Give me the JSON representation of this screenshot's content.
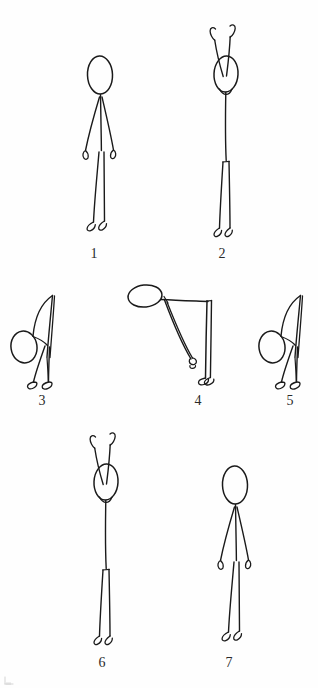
{
  "document": {
    "type": "hand-drawn exercise sequence diagram",
    "subject": "standing forward bend / toe touch stretch sequence",
    "background_color": "#fefefe",
    "ink_color": "#1a1a1a",
    "total_figures": 7
  },
  "figures": [
    {
      "number": "1",
      "pose": "standing upright, arms at sides",
      "orientation": "front view",
      "label_x": 82,
      "label_y": 246,
      "center_x": 100,
      "top_y": 52
    },
    {
      "number": "2",
      "pose": "standing upright, both arms raised overhead",
      "orientation": "front view",
      "label_x": 210,
      "label_y": 246,
      "center_x": 228,
      "top_y": 20
    },
    {
      "number": "3",
      "pose": "bending forward at waist, arms extended down past head",
      "orientation": "side view facing left",
      "label_x": 30,
      "label_y": 393,
      "center_x": 48,
      "top_y": 290
    },
    {
      "number": "4",
      "pose": "deep forward bend, torso horizontal, arms reaching toward feet",
      "orientation": "side view facing left",
      "label_x": 186,
      "label_y": 393,
      "center_x": 204,
      "top_y": 284
    },
    {
      "number": "5",
      "pose": "bending forward at waist, arms extended down past head",
      "orientation": "side view facing left",
      "label_x": 278,
      "label_y": 393,
      "center_x": 296,
      "top_y": 290
    },
    {
      "number": "6",
      "pose": "standing upright, both arms raised overhead",
      "orientation": "front view",
      "label_x": 90,
      "label_y": 655,
      "center_x": 108,
      "top_y": 428
    },
    {
      "number": "7",
      "pose": "standing upright, arms at sides",
      "orientation": "front view",
      "label_x": 217,
      "label_y": 655,
      "center_x": 235,
      "top_y": 462
    }
  ],
  "labels": {
    "one": "1",
    "two": "2",
    "three": "3",
    "four": "4",
    "five": "5",
    "six": "6",
    "seven": "7"
  }
}
